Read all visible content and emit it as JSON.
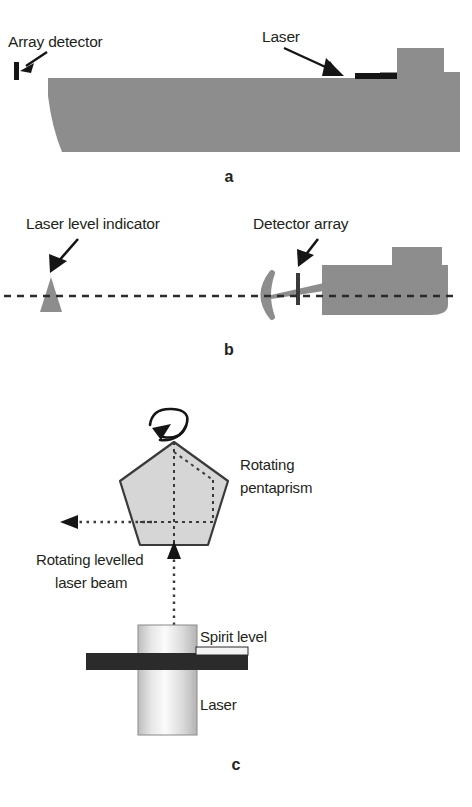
{
  "figure": {
    "background_color": "#ffffff",
    "ink_color": "#231f20",
    "machine_fill": "#8d8d8d",
    "prism_fill": "#d4d4d4",
    "laser_body_light": "#f2f2f2",
    "laser_body_mid": "#c9c9c9",
    "spirit_level_color": "#2b2b2b"
  },
  "panels": [
    {
      "id": "a",
      "letter": "a",
      "caption": "Machine side elevation with laser and array detector",
      "labels": [
        {
          "name": "array-detector",
          "text": "Array detector"
        },
        {
          "name": "laser",
          "text": "Laser"
        }
      ],
      "elements": [
        {
          "name": "array-detector-bar",
          "description": "small black vertical bar at front of machine"
        },
        {
          "name": "laser-bar",
          "description": "small black horizontal bar on machine deck"
        },
        {
          "name": "machine-body",
          "description": "grey machine silhouette with angled front"
        },
        {
          "name": "machine-cab",
          "description": "raised grey cab block at rear"
        }
      ]
    },
    {
      "id": "b",
      "letter": "b",
      "caption": "Levelled reference plane between indicator and detector array",
      "labels": [
        {
          "name": "laser-level-indicator",
          "text": "Laser level indicator"
        },
        {
          "name": "detector-array",
          "text": "Detector array"
        }
      ],
      "elements": [
        {
          "name": "level-reference-line",
          "description": "horizontal dashed laser plane line"
        },
        {
          "name": "indicator-cone",
          "description": "grey tripod cone indicator"
        },
        {
          "name": "grading-blade",
          "description": "grey crescent blade"
        },
        {
          "name": "detector-mast",
          "description": "dark vertical detector mast"
        },
        {
          "name": "machine-body",
          "description": "grey machine with rounded track"
        }
      ]
    },
    {
      "id": "c",
      "letter": "c",
      "caption": "Rotating pentaprism laser transmitter",
      "labels": [
        {
          "name": "rotating-pentaprism",
          "text": "Rotating\npentaprism",
          "line1": "Rotating",
          "line2": "pentaprism"
        },
        {
          "name": "rotating-levelled-laser-beam",
          "text": "Rotating levelled\nlaser beam",
          "line1": "Rotating levelled",
          "line2": "laser beam"
        },
        {
          "name": "spirit-level",
          "text": "Spirit level"
        },
        {
          "name": "laser",
          "text": "Laser"
        }
      ],
      "elements": [
        {
          "name": "rotation-arrow",
          "description": "curved loop arrow indicating rotation"
        },
        {
          "name": "pentaprism",
          "description": "light grey pentagon with dotted internal beam path"
        },
        {
          "name": "output-beam",
          "description": "horizontal dotted beam with left arrowhead"
        },
        {
          "name": "input-beam",
          "description": "vertical dotted beam with up arrowhead"
        },
        {
          "name": "laser-cylinder",
          "description": "shaded vertical cylinder laser body"
        },
        {
          "name": "spirit-level-bar",
          "description": "dark horizontal bar across the laser body"
        }
      ]
    }
  ]
}
